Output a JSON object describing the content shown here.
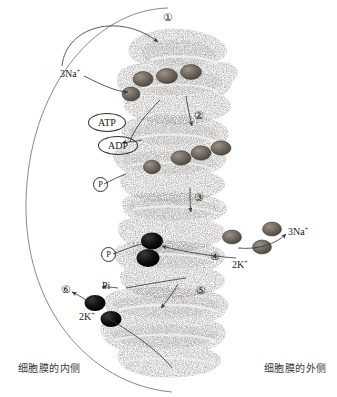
{
  "diagram": {
    "membrane_labels": {
      "inside": "细胞膜的内侧",
      "outside": "细胞膜的外侧"
    },
    "steps": [
      {
        "id": "step-1",
        "label": "①"
      },
      {
        "id": "step-2",
        "label": "②"
      },
      {
        "id": "step-3",
        "label": "③"
      },
      {
        "id": "step-4",
        "label": "④"
      },
      {
        "id": "step-5",
        "label": "⑤"
      },
      {
        "id": "step-6",
        "label": "⑥"
      }
    ],
    "molecules": {
      "sodium_in": {
        "label": "3Na",
        "charge": "+"
      },
      "sodium_out": {
        "label": "3Na",
        "charge": "+"
      },
      "potassium_out": {
        "label": "2K",
        "charge": "+"
      },
      "potassium_in": {
        "label": "2K",
        "charge": "+"
      },
      "atp": "ATP",
      "adp": "ADP",
      "phosphate_bound_upper": "P",
      "phosphate_bound_lower": "P",
      "phosphate_released": "Pi"
    },
    "colors": {
      "sodium_ion": "#6b6258",
      "potassium_ion": "#0d0d0d",
      "protein_stipple": "#4a4a4a",
      "outline": "#555555",
      "text": "#1a1a1a"
    }
  }
}
